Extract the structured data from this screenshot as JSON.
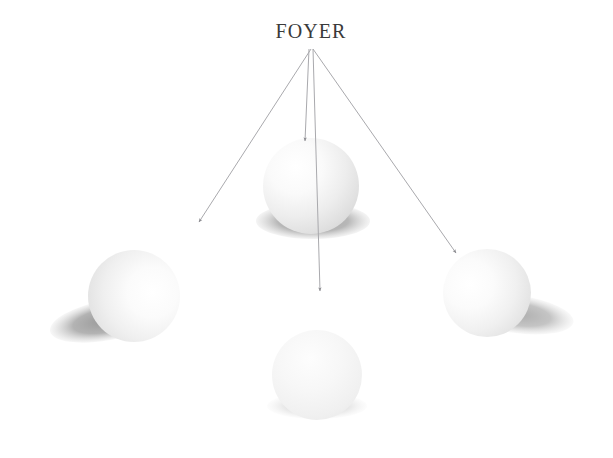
{
  "figure": {
    "title": "FOYER",
    "background_color": "#ffffff"
  },
  "label": {
    "text": "FOYER",
    "x": 311,
    "y": 38,
    "color": "#3a3a3a"
  },
  "rays": {
    "origin": {
      "x": 311,
      "y": 49
    },
    "stroke_color": "#a9a9ad",
    "arrowhead_color": "#8d8d92",
    "items": [
      {
        "name": "ray-to-left-sphere",
        "x1": 311,
        "y1": 49,
        "x2": 199,
        "y2": 222
      },
      {
        "name": "ray-to-top-sphere",
        "x1": 309,
        "y1": 49,
        "x2": 305,
        "y2": 141
      },
      {
        "name": "ray-to-bottom-sphere",
        "x1": 313,
        "y1": 49,
        "x2": 320,
        "y2": 291
      },
      {
        "name": "ray-to-right-sphere",
        "x1": 313,
        "y1": 49,
        "x2": 456,
        "y2": 253
      }
    ]
  },
  "spheres": [
    {
      "name": "sphere-top",
      "cx": 311,
      "cy": 186,
      "r": 48,
      "highlight_x": 296,
      "highlight_y": 168,
      "shadow": {
        "cx": 313,
        "cy": 221,
        "rx": 57,
        "ry": 18,
        "rotate": 0,
        "color": "#a6a6a6"
      }
    },
    {
      "name": "sphere-left",
      "cx": 134,
      "cy": 296,
      "r": 46,
      "highlight_x": 152,
      "highlight_y": 292,
      "shadow": {
        "cx": 108,
        "cy": 320,
        "rx": 59,
        "ry": 20,
        "rotate": -11,
        "color": "#9d9d9d"
      }
    },
    {
      "name": "sphere-right",
      "cx": 487,
      "cy": 293,
      "r": 44,
      "highlight_x": 469,
      "highlight_y": 286,
      "shadow": {
        "cx": 516,
        "cy": 314,
        "rx": 58,
        "ry": 19,
        "rotate": 8,
        "color": "#b0b0b0"
      }
    },
    {
      "name": "sphere-bottom",
      "cx": 317,
      "cy": 375,
      "r": 45,
      "highlight_x": 310,
      "highlight_y": 360,
      "shadow": {
        "cx": 317,
        "cy": 406,
        "rx": 50,
        "ry": 13,
        "rotate": 0,
        "color": "#d3d3d3"
      }
    }
  ]
}
